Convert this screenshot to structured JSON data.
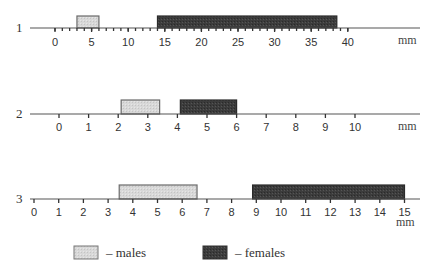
{
  "chart_data": {
    "type": "bar",
    "subtype": "horizontal range bars on three separate scales",
    "title": "",
    "legend": [
      {
        "key": "males",
        "label": "– males",
        "color": "#d6d6d6"
      },
      {
        "key": "females",
        "label": "– females",
        "color": "#3a3a3a"
      }
    ],
    "legend_position": "bottom",
    "grid": false,
    "rows": [
      {
        "id": "1",
        "label": "1",
        "unit": "mm",
        "xlim": [
          0,
          40
        ],
        "major_ticks": [
          0,
          5,
          10,
          15,
          20,
          25,
          30,
          35,
          40
        ],
        "minor_tick_step": 1,
        "ranges": {
          "males": [
            3,
            6
          ],
          "females": [
            14,
            38.5
          ]
        }
      },
      {
        "id": "2",
        "label": "2",
        "unit": "mm",
        "xlim": [
          0,
          10
        ],
        "major_ticks": [
          0,
          1,
          2,
          3,
          4,
          5,
          6,
          7,
          8,
          9,
          10
        ],
        "minor_tick_step": null,
        "ranges": {
          "males": [
            2.1,
            3.4
          ],
          "females": [
            4.1,
            6
          ]
        }
      },
      {
        "id": "3",
        "label": "3",
        "unit": "mm",
        "xlim": [
          0,
          15
        ],
        "major_ticks": [
          0,
          1,
          2,
          3,
          4,
          5,
          6,
          7,
          8,
          9,
          10,
          11,
          12,
          13,
          14,
          15
        ],
        "minor_tick_step": null,
        "ranges": {
          "males": [
            3.45,
            6.6
          ],
          "females": [
            8.85,
            15
          ]
        }
      }
    ]
  },
  "rows": [
    {
      "label": "1",
      "unit": "mm"
    },
    {
      "label": "2",
      "unit": "mm"
    },
    {
      "label": "3",
      "unit": "mm"
    }
  ],
  "legend": {
    "males": "– males",
    "females": "– females"
  }
}
